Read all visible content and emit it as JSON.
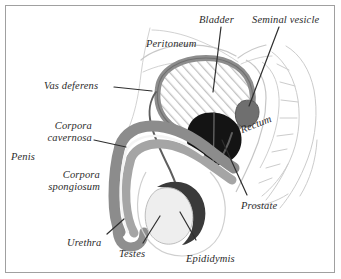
{
  "figure": {
    "background_color": "#ffffff",
    "border_color": "#a0a0a0",
    "label_color": "#2b2b2b"
  },
  "palette": {
    "outline_light": "#cfcfcf",
    "body_outline": "#bdbdbd",
    "bladder_wall": "#8d8d8d",
    "bladder_hatch": "#bcbcbc",
    "prostate": "#1a1a1a",
    "seminal_vesicle": "#6e6e6e",
    "penis_body": "#9a9a9a",
    "corpora_cavernosa": "#8a8a8a",
    "corpora_spongiosum": "#a8a8a8",
    "urethra_stripe": "#f2f2f2",
    "testis": "#ededed",
    "epididymis": "#3d3d3d",
    "vas_deferens": "#5a5a5a",
    "leader_line": "#2f2f2f"
  },
  "labels": [
    {
      "id": "bladder",
      "text": "Bladder",
      "lines": [
        "Bladder"
      ]
    },
    {
      "id": "seminal-vesicle",
      "text": "Seminal vesicle",
      "lines": [
        "Seminal vesicle"
      ]
    },
    {
      "id": "peritoneum",
      "text": "Peritoneum",
      "lines": [
        "Peritoneum"
      ]
    },
    {
      "id": "vas-deferens",
      "text": "Vas deferens",
      "lines": [
        "Vas deferens"
      ]
    },
    {
      "id": "corpora-cavernosa",
      "text": "Corpora cavernosa",
      "lines": [
        "Corpora",
        "cavernosa"
      ]
    },
    {
      "id": "penis",
      "text": "Penis",
      "lines": [
        "Penis"
      ]
    },
    {
      "id": "corpora-spongiosum",
      "text": "Corpora spongiosum",
      "lines": [
        "Corpora",
        "spongiosum"
      ]
    },
    {
      "id": "rectum",
      "text": "Rectum",
      "lines": [
        "Rectum"
      ]
    },
    {
      "id": "prostate",
      "text": "Prostate",
      "lines": [
        "Prostate"
      ]
    },
    {
      "id": "urethra",
      "text": "Urethra",
      "lines": [
        "Urethra"
      ]
    },
    {
      "id": "testes",
      "text": "Testes",
      "lines": [
        "Testes"
      ]
    },
    {
      "id": "epididymis",
      "text": "Epididymis",
      "lines": [
        "Epididymis"
      ]
    }
  ]
}
